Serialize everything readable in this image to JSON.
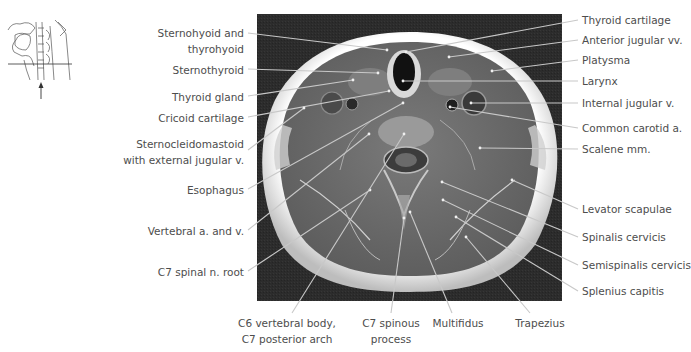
{
  "figure": {
    "orientation_thumbnail": {
      "icon": "sagittal-neck-sketch-icon",
      "marker": "section-plane-line",
      "arrow": "up-arrow-icon"
    },
    "image": {
      "description": "Axial MRI of the neck at level C6/C7",
      "palette": {
        "background": "#2a2a2a",
        "fat": "#f4f4f4",
        "muscle": "#6e6e6e",
        "leader_line": "#c8c8c8"
      }
    },
    "labels_left": [
      {
        "id": "sternohyoid",
        "text": "Sternohyoid and\nthyrohyoid"
      },
      {
        "id": "sternothyroid",
        "text": "Sternothyroid"
      },
      {
        "id": "thyroid-gland",
        "text": "Thyroid gland"
      },
      {
        "id": "cricoid",
        "text": "Cricoid cartilage"
      },
      {
        "id": "scm",
        "text": "Sternocleidomastoid\nwith external jugular v."
      },
      {
        "id": "esophagus",
        "text": "Esophagus"
      },
      {
        "id": "vertebral",
        "text": "Vertebral a. and v."
      },
      {
        "id": "c7-root",
        "text": "C7 spinal n. root"
      }
    ],
    "labels_right": [
      {
        "id": "thyroid-cartilage",
        "text": "Thyroid cartilage"
      },
      {
        "id": "anterior-jugular",
        "text": "Anterior jugular vv."
      },
      {
        "id": "platysma",
        "text": "Platysma"
      },
      {
        "id": "larynx",
        "text": "Larynx"
      },
      {
        "id": "internal-jugular",
        "text": "Internal jugular v."
      },
      {
        "id": "common-carotid",
        "text": "Common carotid a."
      },
      {
        "id": "scalene",
        "text": "Scalene mm."
      },
      {
        "id": "levator",
        "text": "Levator scapulae"
      },
      {
        "id": "spinalis",
        "text": "Spinalis cervicis"
      },
      {
        "id": "semispinalis",
        "text": "Semispinalis cervicis"
      },
      {
        "id": "splenius",
        "text": "Splenius capitis"
      }
    ],
    "labels_bottom": [
      {
        "id": "c6-body",
        "text": "C6 vertebral body,\nC7 posterior arch"
      },
      {
        "id": "c7-spinous",
        "text": "C7 spinous\nprocess"
      },
      {
        "id": "multifidus",
        "text": "Multifidus"
      },
      {
        "id": "trapezius",
        "text": "Trapezius"
      }
    ]
  }
}
